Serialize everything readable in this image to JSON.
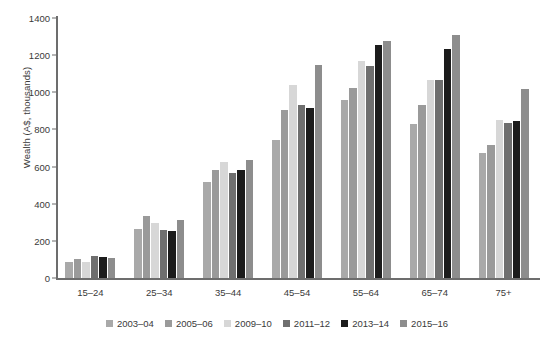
{
  "chart_data": {
    "type": "bar",
    "title": "",
    "subtitle": "",
    "xlabel": "",
    "ylabel": "Wealth (A$, thousands)",
    "ylim": [
      0,
      1400
    ],
    "ytick_step": 200,
    "yticks": [
      "1400",
      "1200",
      "1000",
      "800",
      "600",
      "400",
      "200",
      "0"
    ],
    "grid": false,
    "legend_position": "bottom",
    "categories": [
      "15–24",
      "25–34",
      "35–44",
      "45–54",
      "55–64",
      "65–74",
      "75+"
    ],
    "series": [
      {
        "name": "2003–04",
        "color": "#a9a9a9",
        "values": [
          85,
          265,
          515,
          745,
          960,
          830,
          675
        ]
      },
      {
        "name": "2005–06",
        "color": "#9a9a9a",
        "values": [
          105,
          335,
          580,
          905,
          1025,
          930,
          715
        ]
      },
      {
        "name": "2009–10",
        "color": "#d7d7d7",
        "values": [
          88,
          295,
          625,
          1040,
          1170,
          1065,
          850
        ]
      },
      {
        "name": "2011–12",
        "color": "#6f6f6f",
        "values": [
          120,
          260,
          565,
          930,
          1140,
          1065,
          835
        ]
      },
      {
        "name": "2013–14",
        "color": "#1c1c1c",
        "values": [
          115,
          255,
          580,
          915,
          1255,
          1235,
          845
        ]
      },
      {
        "name": "2015–16",
        "color": "#8d8d8d",
        "values": [
          108,
          310,
          635,
          1145,
          1275,
          1310,
          1020
        ]
      }
    ]
  },
  "axis": {
    "y_title": "Wealth (A$, thousands)"
  }
}
